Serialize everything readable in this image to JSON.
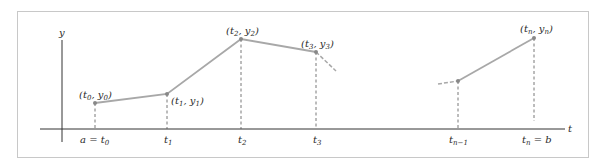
{
  "figure": {
    "colors": {
      "frame": "#c8c8c8",
      "axis": "#333333",
      "curve": "#a8a8a8",
      "dashed": "#555555",
      "text": "#2a2a2a"
    },
    "axes": {
      "x_label": "t",
      "y_label": "y"
    },
    "points": [
      {
        "id": "p0",
        "label": "(t0, y0)",
        "x": 95,
        "y": 103
      },
      {
        "id": "p1",
        "label": "(t1, y1)",
        "x": 167,
        "y": 94
      },
      {
        "id": "p2",
        "label": "(t2, y2)",
        "x": 241,
        "y": 39
      },
      {
        "id": "p3",
        "label": "(t3, y3)",
        "x": 316,
        "y": 52
      },
      {
        "id": "pn1",
        "label": "",
        "x": 458,
        "y": 81
      },
      {
        "id": "pn",
        "label": "(tn, yn)",
        "x": 534,
        "y": 38
      }
    ],
    "ticks": [
      {
        "label": "a = t0",
        "x": 95
      },
      {
        "label": "t1",
        "x": 167
      },
      {
        "label": "t2",
        "x": 241
      },
      {
        "label": "t3",
        "x": 316
      },
      {
        "label": "tn−1",
        "x": 458
      },
      {
        "label": "tn = b",
        "x": 534
      }
    ]
  }
}
